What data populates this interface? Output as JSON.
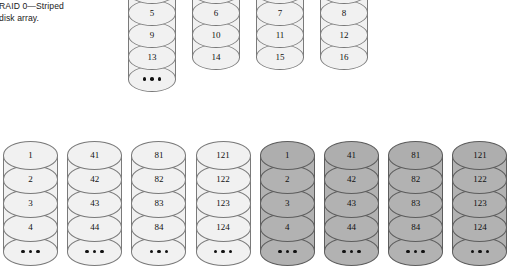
{
  "caption": {
    "text": "RAID 0—Striped\ndisk array."
  },
  "colors": {
    "light_fill": "#f1f1f1",
    "shaded_fill": "#b2b2b2",
    "outline": "#7a7a7a",
    "shaded_outline": "#5d5d5d",
    "text": "#111111",
    "background": "#ffffff"
  },
  "ellipsis": "•••",
  "top_row": {
    "label": "striped-disks-top",
    "disks": [
      {
        "name": "disk-1",
        "shaded": false,
        "blocks": [
          "1",
          "5",
          "9",
          "13"
        ],
        "ellipsis": true
      },
      {
        "name": "disk-2",
        "shaded": false,
        "blocks": [
          "2",
          "6",
          "10",
          "14"
        ],
        "ellipsis": false
      },
      {
        "name": "disk-3",
        "shaded": false,
        "blocks": [
          "3",
          "7",
          "11",
          "15"
        ],
        "ellipsis": false
      },
      {
        "name": "disk-4",
        "shaded": false,
        "blocks": [
          "4",
          "8",
          "12",
          "16"
        ],
        "ellipsis": false
      }
    ]
  },
  "bottom_row": {
    "label": "mirrored-striped-disks-bottom",
    "disks": [
      {
        "name": "disk-1",
        "shaded": false,
        "blocks": [
          "1",
          "2",
          "3",
          "4"
        ],
        "ellipsis": true
      },
      {
        "name": "disk-2",
        "shaded": false,
        "blocks": [
          "41",
          "42",
          "43",
          "44"
        ],
        "ellipsis": true
      },
      {
        "name": "disk-3",
        "shaded": false,
        "blocks": [
          "81",
          "82",
          "83",
          "84"
        ],
        "ellipsis": true
      },
      {
        "name": "disk-4",
        "shaded": false,
        "blocks": [
          "121",
          "122",
          "123",
          "124"
        ],
        "ellipsis": true
      },
      {
        "name": "disk-5",
        "shaded": true,
        "blocks": [
          "1",
          "2",
          "3",
          "4"
        ],
        "ellipsis": true
      },
      {
        "name": "disk-6",
        "shaded": true,
        "blocks": [
          "41",
          "42",
          "43",
          "44"
        ],
        "ellipsis": true
      },
      {
        "name": "disk-7",
        "shaded": true,
        "blocks": [
          "81",
          "82",
          "83",
          "84"
        ],
        "ellipsis": true
      },
      {
        "name": "disk-8",
        "shaded": true,
        "blocks": [
          "121",
          "122",
          "123",
          "124"
        ],
        "ellipsis": true
      }
    ]
  },
  "geometry": {
    "top_row": {
      "x_start": 128,
      "pitch": 64,
      "width": 48,
      "y_start": -22,
      "band_h": 26,
      "band_step": 22
    },
    "bottom_row": {
      "x_start": 3,
      "pitch": 64.2,
      "width": 55,
      "y_start": 141,
      "band_h": 29,
      "band_step": 24
    }
  }
}
